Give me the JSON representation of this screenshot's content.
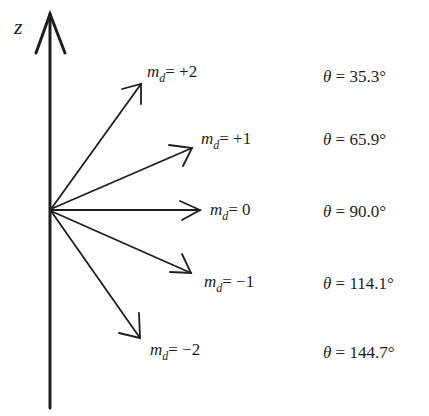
{
  "axis": {
    "label": "z"
  },
  "vectors": [
    {
      "md_label": "m",
      "md_sub": "d",
      "md_value": "= +2",
      "theta_symbol": "θ",
      "theta_value": "= 35.3°"
    },
    {
      "md_label": "m",
      "md_sub": "d",
      "md_value": "= +1",
      "theta_symbol": "θ",
      "theta_value": "= 65.9°"
    },
    {
      "md_label": "m",
      "md_sub": "d",
      "md_value": "= 0",
      "theta_symbol": "θ",
      "theta_value": "= 90.0°"
    },
    {
      "md_label": "m",
      "md_sub": "d",
      "md_value": "= −1",
      "theta_symbol": "θ",
      "theta_value": "= 114.1°"
    },
    {
      "md_label": "m",
      "md_sub": "d",
      "md_value": "= −2",
      "theta_symbol": "θ",
      "theta_value": "= 144.7°"
    }
  ],
  "colors": {
    "ink": "#1e1e1e",
    "background": "#ffffff"
  }
}
